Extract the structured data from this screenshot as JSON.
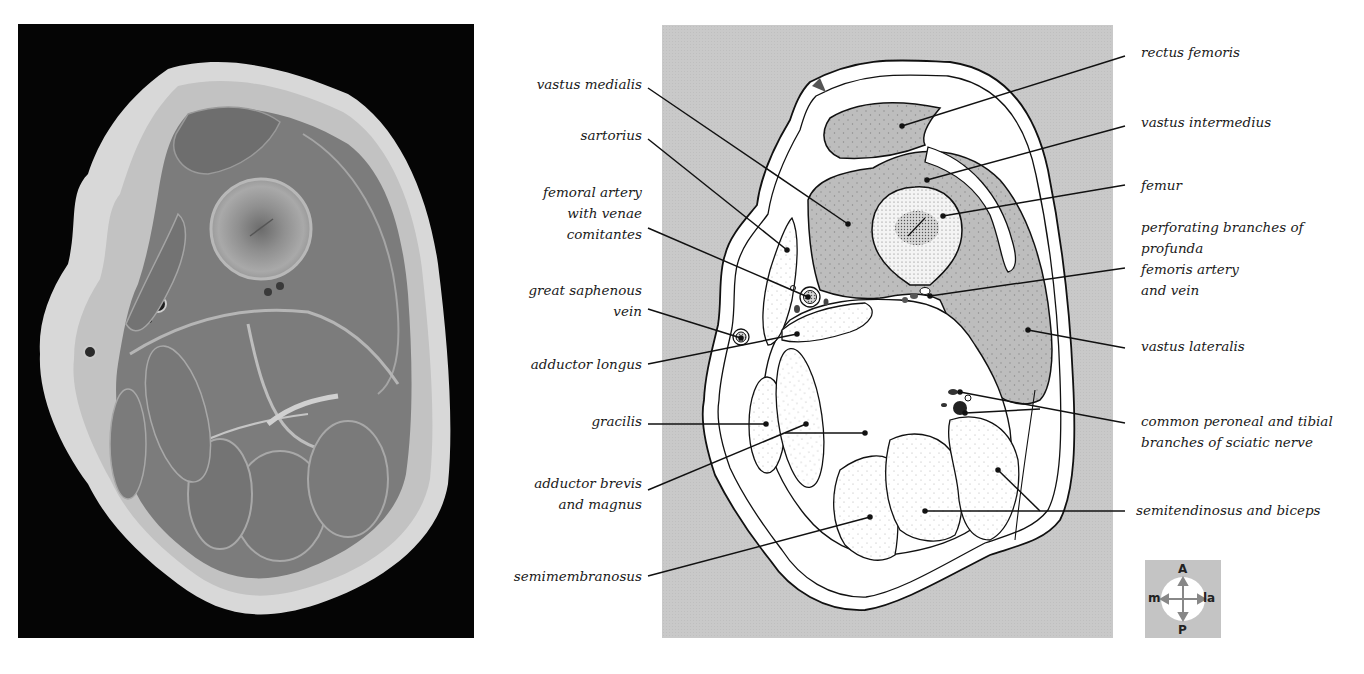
{
  "figure": {
    "photo": {
      "description": "Photograph of transverse section through the thigh",
      "background": "#050505"
    },
    "diagram": {
      "background": "#c9c9c9",
      "muscle_fill": "#bdbdbd",
      "tissue_fill": "#ffffff"
    }
  },
  "labels_left": [
    {
      "id": "vastus-medialis",
      "lines": [
        "vastus medialis"
      ]
    },
    {
      "id": "sartorius",
      "lines": [
        "sartorius"
      ]
    },
    {
      "id": "femoral-artery",
      "lines": [
        "femoral artery",
        "with venae",
        "comitantes"
      ]
    },
    {
      "id": "great-saphenous-vein",
      "lines": [
        "great saphenous",
        "vein"
      ]
    },
    {
      "id": "adductor-longus",
      "lines": [
        "adductor longus"
      ]
    },
    {
      "id": "gracilis",
      "lines": [
        "gracilis"
      ]
    },
    {
      "id": "adductor-brevis-magnus",
      "lines": [
        "adductor brevis",
        "and magnus"
      ]
    },
    {
      "id": "semimembranosus",
      "lines": [
        "semimembranosus"
      ]
    }
  ],
  "labels_right": [
    {
      "id": "rectus-femoris",
      "lines": [
        "rectus femoris"
      ]
    },
    {
      "id": "vastus-intermedius",
      "lines": [
        "vastus intermedius"
      ]
    },
    {
      "id": "femur",
      "lines": [
        "femur"
      ]
    },
    {
      "id": "perforating-branches",
      "lines": [
        "perforating branches of",
        "profunda",
        "femoris artery",
        "and vein"
      ]
    },
    {
      "id": "vastus-lateralis",
      "lines": [
        "vastus lateralis"
      ]
    },
    {
      "id": "sciatic-branches",
      "lines": [
        "common peroneal and tibial",
        "branches of sciatic nerve"
      ]
    },
    {
      "id": "semitendinosus-biceps",
      "lines": [
        "semitendinosus and biceps"
      ]
    }
  ],
  "compass": {
    "anterior": "A",
    "posterior": "P",
    "medial": "m",
    "lateral": "la"
  }
}
